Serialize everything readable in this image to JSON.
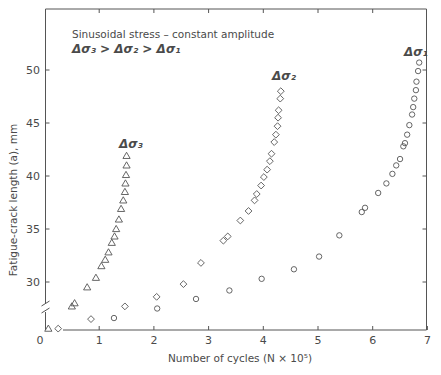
{
  "chart_data": {
    "type": "scatter",
    "title": "",
    "annotation": {
      "line1": "Sinusoidal stress – constant amplitude",
      "line2": "Δσ₃ > Δσ₂ > Δσ₁"
    },
    "xlabel": "Number of cycles (N × 10⁵)",
    "ylabel": "Fatigue-crack length (a), mm",
    "xlim": [
      0,
      7
    ],
    "ylim": [
      25.4,
      55.8
    ],
    "x_ticks": [
      0,
      1,
      2,
      3,
      4,
      5,
      6,
      7
    ],
    "y_ticks": [
      30,
      35,
      40,
      45,
      50
    ],
    "y_axis_break": "between origin and 30",
    "grid": false,
    "legend": "inline series labels",
    "ink_color": "#555555",
    "series": [
      {
        "name": "Δσ₃",
        "marker": "triangle",
        "label_at": [
          1.36,
          42.6
        ],
        "points": [
          [
            0.07,
            25.6
          ],
          [
            0.5,
            27.7
          ],
          [
            0.55,
            28.0
          ],
          [
            0.78,
            29.5
          ],
          [
            0.94,
            30.4
          ],
          [
            1.04,
            31.5
          ],
          [
            1.11,
            32.1
          ],
          [
            1.17,
            32.8
          ],
          [
            1.23,
            33.7
          ],
          [
            1.28,
            34.3
          ],
          [
            1.31,
            35.0
          ],
          [
            1.36,
            35.9
          ],
          [
            1.4,
            36.9
          ],
          [
            1.44,
            37.7
          ],
          [
            1.47,
            38.5
          ],
          [
            1.48,
            39.3
          ],
          [
            1.49,
            40.1
          ],
          [
            1.5,
            41.0
          ],
          [
            1.5,
            41.9
          ]
        ]
      },
      {
        "name": "Δσ₂",
        "marker": "diamond",
        "label_at": [
          4.16,
          49.1
        ],
        "points": [
          [
            0.25,
            25.6
          ],
          [
            0.85,
            26.5
          ],
          [
            1.47,
            27.7
          ],
          [
            2.05,
            28.6
          ],
          [
            2.54,
            29.8
          ],
          [
            2.86,
            31.8
          ],
          [
            3.27,
            33.9
          ],
          [
            3.35,
            34.3
          ],
          [
            3.58,
            35.8
          ],
          [
            3.73,
            36.7
          ],
          [
            3.84,
            37.7
          ],
          [
            3.88,
            38.3
          ],
          [
            3.96,
            39.1
          ],
          [
            4.01,
            39.9
          ],
          [
            4.07,
            40.6
          ],
          [
            4.12,
            41.4
          ],
          [
            4.15,
            42.1
          ],
          [
            4.2,
            43.2
          ],
          [
            4.23,
            43.9
          ],
          [
            4.26,
            44.7
          ],
          [
            4.27,
            45.5
          ],
          [
            4.28,
            46.2
          ],
          [
            4.31,
            47.3
          ],
          [
            4.32,
            48.0
          ]
        ]
      },
      {
        "name": "Δσ₁",
        "marker": "circle",
        "label_at": [
          6.57,
          51.3
        ],
        "points": [
          [
            1.27,
            26.6
          ],
          [
            2.06,
            27.5
          ],
          [
            2.77,
            28.4
          ],
          [
            3.38,
            29.2
          ],
          [
            3.97,
            30.3
          ],
          [
            4.56,
            31.2
          ],
          [
            5.02,
            32.4
          ],
          [
            5.39,
            34.4
          ],
          [
            5.8,
            36.6
          ],
          [
            5.86,
            37.0
          ],
          [
            6.1,
            38.4
          ],
          [
            6.25,
            39.3
          ],
          [
            6.36,
            40.2
          ],
          [
            6.43,
            41.0
          ],
          [
            6.5,
            41.6
          ],
          [
            6.56,
            42.8
          ],
          [
            6.59,
            43.1
          ],
          [
            6.63,
            43.9
          ],
          [
            6.67,
            44.8
          ],
          [
            6.72,
            45.8
          ],
          [
            6.74,
            46.5
          ],
          [
            6.76,
            47.3
          ],
          [
            6.79,
            48.1
          ],
          [
            6.8,
            48.9
          ],
          [
            6.83,
            49.9
          ],
          [
            6.85,
            50.7
          ]
        ]
      }
    ]
  }
}
